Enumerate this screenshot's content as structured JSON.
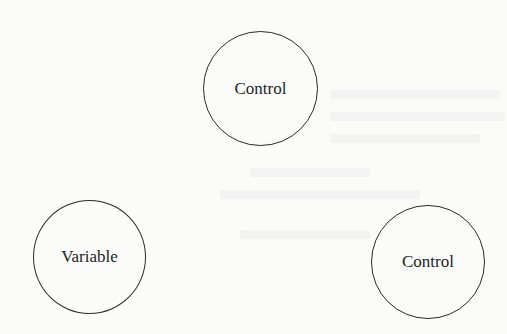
{
  "diagram": {
    "nodes": [
      {
        "id": "top",
        "label": "Control",
        "cx": 260,
        "cy": 88,
        "r": 57
      },
      {
        "id": "left",
        "label": "Variable",
        "cx": 89,
        "cy": 257,
        "r": 56
      },
      {
        "id": "right",
        "label": "Control",
        "cx": 428,
        "cy": 262,
        "r": 57
      }
    ],
    "edges": []
  }
}
